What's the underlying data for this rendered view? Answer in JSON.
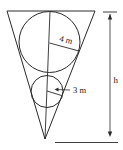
{
  "diagram": {
    "type": "geometry",
    "labels": {
      "large_radius": "4 m",
      "small_radius": "3 m",
      "height": "h"
    },
    "colors": {
      "stroke": "#2a2a2a",
      "background": "#ffffff"
    }
  }
}
